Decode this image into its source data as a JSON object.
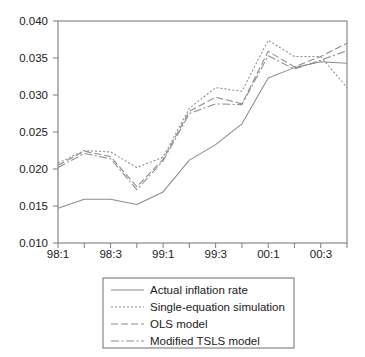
{
  "chart_data": {
    "type": "line",
    "title": "",
    "subtitle": "",
    "xlabel": "",
    "ylabel": "",
    "grid": false,
    "legend_position": "bottom-center",
    "ylim": [
      0.01,
      0.04
    ],
    "ytick_values": [
      0.01,
      0.015,
      0.02,
      0.025,
      0.03,
      0.035,
      0.04
    ],
    "ytick_labels": [
      "0.010",
      "0.015",
      "0.020",
      "0.025",
      "0.030",
      "0.035",
      "0.040"
    ],
    "x": [
      "98:1",
      "98:2",
      "98:3",
      "98:4",
      "99:1",
      "99:2",
      "99:3",
      "99:4",
      "00:1",
      "00:2",
      "00:3",
      "00:4"
    ],
    "xtick_labels": [
      "98:1",
      "98:3",
      "99:1",
      "99:3",
      "00:1",
      "00:3"
    ],
    "xtick_indices": [
      0,
      2,
      4,
      6,
      8,
      10
    ],
    "series": [
      {
        "name": "Actual inflation rate",
        "style": "solid",
        "dasharray": "none",
        "values": [
          0.0147,
          0.0159,
          0.0159,
          0.0152,
          0.0169,
          0.0212,
          0.0233,
          0.0261,
          0.0323,
          0.0337,
          0.0345,
          0.0343
        ]
      },
      {
        "name": "Single-equation simulation",
        "style": "dotted",
        "dasharray": "2,2",
        "values": [
          0.0208,
          0.0225,
          0.0223,
          0.0202,
          0.0216,
          0.0282,
          0.031,
          0.0305,
          0.0374,
          0.0352,
          0.0352,
          0.031
        ]
      },
      {
        "name": "OLS model",
        "style": "dashed",
        "dasharray": "7,3",
        "values": [
          0.0205,
          0.0224,
          0.0217,
          0.0176,
          0.0213,
          0.0278,
          0.0297,
          0.0288,
          0.0359,
          0.0338,
          0.0352,
          0.037
        ]
      },
      {
        "name": "Modified TSLS model",
        "style": "dashdot",
        "dasharray": "8,2.5,2,2.5",
        "values": [
          0.0202,
          0.0221,
          0.0214,
          0.0172,
          0.0211,
          0.0275,
          0.0288,
          0.0287,
          0.0353,
          0.0335,
          0.0347,
          0.036
        ]
      }
    ]
  },
  "legend": {
    "items": [
      {
        "label": "Actual inflation rate"
      },
      {
        "label": "Single-equation simulation"
      },
      {
        "label": "OLS model"
      },
      {
        "label": "Modified TSLS model"
      }
    ]
  }
}
